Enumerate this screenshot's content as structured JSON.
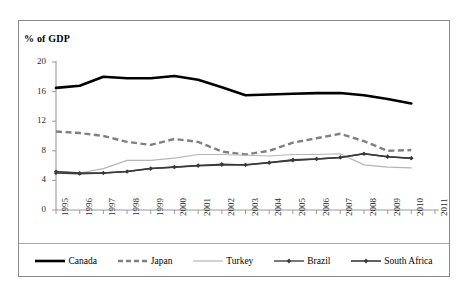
{
  "chart": {
    "axis_title": "% of GDP",
    "border_color": "#8a8a8a"
  },
  "chart_data": {
    "type": "line",
    "title": "",
    "subtitle": "",
    "xlabel": "",
    "ylabel": "% of GDP",
    "ylim": [
      0,
      20
    ],
    "yticks": [
      0,
      4,
      8,
      12,
      16,
      20
    ],
    "grid": false,
    "legend_position": "bottom",
    "categories": [
      1995,
      1996,
      1997,
      1998,
      1999,
      2000,
      2001,
      2002,
      2003,
      2004,
      2005,
      2006,
      2007,
      2008,
      2009,
      2010,
      2011
    ],
    "xtick_labels": [
      "1995",
      "1996",
      "1997",
      "1998",
      "1999",
      "2000",
      "2001",
      "2002",
      "2003",
      "2004",
      "2005",
      "2006",
      "2007",
      "2008",
      "2009",
      "2010",
      "2011"
    ],
    "series": [
      {
        "name": "Canada",
        "color": "#000000",
        "style": "solid",
        "width": 2.6,
        "marker": "none",
        "values": [
          16.5,
          16.8,
          18.0,
          17.8,
          17.8,
          18.1,
          17.6,
          16.6,
          15.5,
          15.6,
          15.7,
          15.8,
          15.8,
          15.5,
          15.0,
          14.4,
          null
        ]
      },
      {
        "name": "Japan",
        "color": "#808080",
        "style": "dashed",
        "width": 2.4,
        "marker": "none",
        "values": [
          10.6,
          10.4,
          10.0,
          9.2,
          8.8,
          9.6,
          9.2,
          7.9,
          7.5,
          8.0,
          9.1,
          9.7,
          10.3,
          9.3,
          8.0,
          8.1,
          null
        ]
      },
      {
        "name": "Turkey",
        "color": "#b5b5b5",
        "style": "solid",
        "width": 1.2,
        "marker": "none",
        "values": [
          5.2,
          5.0,
          5.6,
          6.7,
          6.7,
          7.0,
          7.5,
          7.5,
          7.4,
          7.3,
          7.5,
          7.5,
          7.6,
          6.1,
          5.8,
          5.7,
          null
        ]
      },
      {
        "name": "Brazil",
        "color": "#404040",
        "style": "solid",
        "width": 1.4,
        "marker": "diamond",
        "values": [
          5.2,
          5.0,
          5.0,
          5.2,
          5.6,
          5.8,
          6.0,
          6.2,
          6.1,
          6.4,
          6.8,
          6.9,
          7.1,
          7.6,
          7.2,
          7.0,
          null
        ]
      },
      {
        "name": "South Africa",
        "color": "#3a3a3a",
        "style": "solid",
        "width": 1.6,
        "marker": "diamond",
        "values": [
          5.0,
          4.9,
          5.0,
          5.2,
          5.6,
          5.8,
          6.0,
          6.1,
          6.1,
          6.4,
          6.7,
          6.9,
          7.1,
          7.6,
          7.2,
          7.0,
          null
        ]
      }
    ]
  },
  "legend": {
    "items": [
      {
        "label": "Canada"
      },
      {
        "label": "Japan"
      },
      {
        "label": "Turkey"
      },
      {
        "label": "Brazil"
      },
      {
        "label": "South Africa"
      }
    ]
  }
}
